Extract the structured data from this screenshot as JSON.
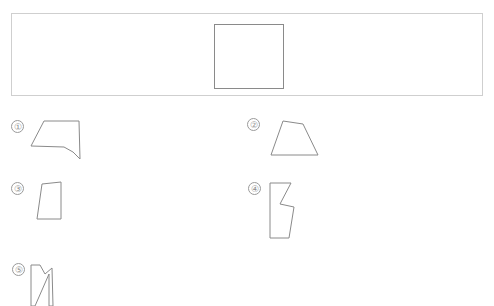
{
  "page": {
    "background_color": "#ffffff",
    "width": 494,
    "height": 304,
    "stroke_color": "#8a8a8a",
    "banner_border_color": "#cfcfcf",
    "label_text_color": "#8f8f8f"
  },
  "banner": {
    "name": "answer-banner",
    "x": 11,
    "y": 13,
    "width": 472,
    "height": 83,
    "square": {
      "name": "banner-target-square",
      "x": 202,
      "y": 10,
      "width": 70,
      "height": 65
    }
  },
  "shapes": [
    {
      "label": "①",
      "number": "1",
      "name": "shape-1",
      "type": "polygon",
      "label_x": 11,
      "label_y": 120,
      "shape_x": 27,
      "shape_y": 118,
      "viewbox": "0 0 56 44",
      "points": "17,3 52,3 53,41 46,34 37,29 4,28 17,3"
    },
    {
      "label": "②",
      "number": "2",
      "name": "shape-2",
      "type": "polygon",
      "label_x": 247,
      "label_y": 118,
      "shape_x": 266,
      "shape_y": 117,
      "viewbox": "0 0 56 42",
      "points": "17,4 37,7 52,38 5,38 17,4"
    },
    {
      "label": "③",
      "number": "3",
      "name": "shape-3",
      "type": "polygon",
      "label_x": 11,
      "label_y": 182,
      "shape_x": 33,
      "shape_y": 180,
      "viewbox": "0 0 36 44",
      "points": "9,4 28,2 28,39 4,39 9,4"
    },
    {
      "label": "④",
      "number": "4",
      "name": "shape-4",
      "type": "polygon",
      "label_x": 248,
      "label_y": 182,
      "shape_x": 266,
      "shape_y": 180,
      "viewbox": "0 0 36 62",
      "points": "4,3 25,3 14,24 28,27 23,58 4,58 4,3"
    },
    {
      "label": "⑤",
      "number": "5",
      "name": "shape-5",
      "type": "polygon-clipped",
      "label_x": 12,
      "label_y": 263,
      "shape_x": 26,
      "shape_y": 260,
      "viewbox": "0 0 32 46",
      "points": "5,5 14,5 19,14 26,8 27,46 23,46 23,14 9,46 5,46 5,5"
    }
  ]
}
